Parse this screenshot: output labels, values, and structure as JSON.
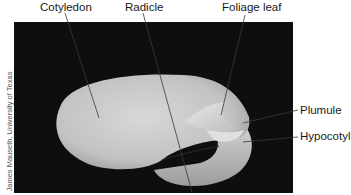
{
  "figure": {
    "credit": "James Mauseth, University of Texas",
    "labels": [
      {
        "id": "cotyledon",
        "text": "Cotyledon"
      },
      {
        "id": "radicle",
        "text": "Radicle"
      },
      {
        "id": "foliage-leaf",
        "text": "Foliage leaf"
      },
      {
        "id": "plumule",
        "text": "Plumule"
      },
      {
        "id": "hypocotyl",
        "text": "Hypocotyl"
      }
    ],
    "colors": {
      "background": "#0e0e0e",
      "embryo": "#c9c9c9",
      "leader_line": "#3a3a3a",
      "text": "#1a1a1a"
    }
  }
}
